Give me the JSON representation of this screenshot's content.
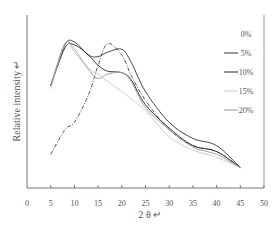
{
  "chart_data": {
    "type": "line",
    "title": "",
    "xlabel": "2 θ ↵",
    "ylabel": "Relative intensity ↵",
    "xlim": [
      0,
      50
    ],
    "ylim": [
      0,
      100
    ],
    "x_ticks": [
      "0",
      "5",
      "10",
      "15",
      "20",
      "25",
      "30",
      "35",
      "40",
      "45",
      "50"
    ],
    "y_ticks": [],
    "grid": false,
    "legend_position": "upper right",
    "x": [
      5,
      8,
      10,
      13,
      15,
      17,
      20,
      22,
      25,
      30,
      35,
      40,
      45
    ],
    "series": [
      {
        "name": "0%",
        "style": "dash-dot",
        "color": "#444444",
        "values": [
          23,
          40,
          45,
          64,
          84,
          99,
          91,
          77,
          60,
          40,
          29,
          25,
          14
        ]
      },
      {
        "name": "5%",
        "style": "solid",
        "color": "#333333",
        "values": [
          70,
          98,
          100,
          91,
          90,
          93,
          95,
          86,
          66,
          45,
          34,
          29,
          14
        ]
      },
      {
        "name": "10%",
        "style": "solid",
        "color": "#222222",
        "values": [
          70,
          96,
          98,
          91,
          84,
          80,
          79,
          74,
          57,
          41,
          29,
          25,
          14
        ]
      },
      {
        "name": "15%",
        "style": "solid",
        "color": "#c8c8c8",
        "values": [
          68,
          99,
          93,
          82,
          78,
          73,
          66,
          61,
          53,
          35,
          26,
          21,
          14
        ]
      },
      {
        "name": "20%",
        "style": "solid",
        "color": "#999999",
        "values": [
          70,
          99,
          95,
          81,
          75,
          78,
          79,
          73,
          55,
          40,
          28,
          23,
          14
        ]
      }
    ]
  }
}
